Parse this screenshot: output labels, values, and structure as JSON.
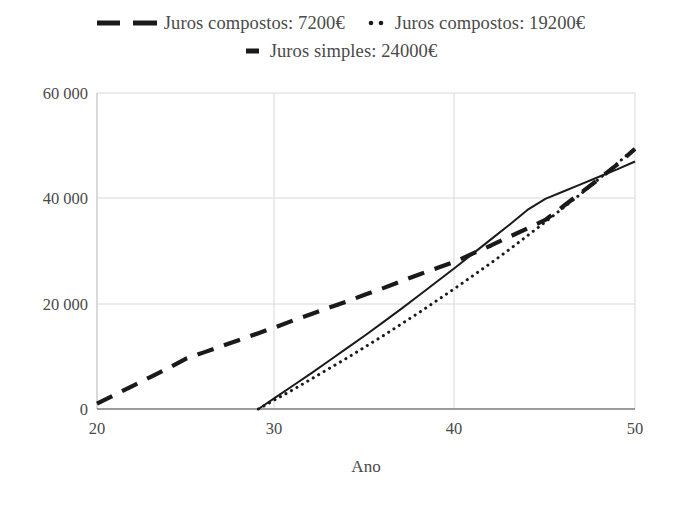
{
  "chart_data": {
    "type": "line",
    "title": "",
    "subtitle": "",
    "xlabel": "Ano",
    "ylabel": "",
    "xlim": [
      20,
      50
    ],
    "ylim": [
      0,
      60000
    ],
    "grid": true,
    "legend_position": "top",
    "x_ticks": [
      "20",
      "30",
      "40",
      "50"
    ],
    "x_tick_values": [
      20,
      30,
      40,
      50
    ],
    "y_ticks": [
      "0",
      "20 000",
      "40 000",
      "60 000"
    ],
    "y_tick_values": [
      0,
      20000,
      40000,
      60000
    ],
    "series": [
      {
        "name": "Juros compostos: 7200€",
        "style": "dashed",
        "marker": "long-dash-line",
        "color": "#1a1a1a",
        "x": [
          20,
          21,
          22,
          23,
          24,
          25,
          26,
          27,
          28,
          29,
          30,
          31,
          32,
          33,
          34,
          35,
          36,
          37,
          38,
          39,
          40,
          41,
          42,
          43,
          44,
          45,
          46,
          47,
          48,
          49,
          50
        ],
        "values": [
          1000,
          2700,
          4400,
          6100,
          7800,
          9600,
          10800,
          12000,
          13200,
          14400,
          15600,
          16900,
          18100,
          19300,
          20500,
          21800,
          23000,
          24300,
          25600,
          26800,
          28000,
          29600,
          31100,
          32700,
          34300,
          35900,
          38500,
          41100,
          43700,
          46400,
          49400
        ]
      },
      {
        "name": "Juros compostos: 19200€",
        "style": "dotted",
        "marker": "dotted-line",
        "color": "#1a1a1a",
        "x": [
          29,
          30,
          31,
          32,
          33,
          34,
          35,
          36,
          37,
          38,
          39,
          40,
          41,
          42,
          43,
          44,
          45,
          46,
          47,
          48,
          49,
          50
        ],
        "values": [
          0,
          1900,
          3800,
          5800,
          7800,
          9800,
          11900,
          14000,
          16200,
          18400,
          20700,
          23000,
          25400,
          27800,
          30300,
          32900,
          35500,
          38200,
          40900,
          43700,
          46600,
          49500
        ]
      },
      {
        "name": "Juros simples: 24000€",
        "style": "solid",
        "marker": "solid-line",
        "color": "#1a1a1a",
        "x": [
          29,
          30,
          31,
          32,
          33,
          34,
          35,
          36,
          37,
          38,
          39,
          40,
          41,
          42,
          43,
          44,
          45,
          46,
          47,
          48,
          49,
          50
        ],
        "values": [
          0,
          2300,
          4600,
          6900,
          9300,
          11700,
          14100,
          16600,
          19100,
          21700,
          24300,
          26900,
          29600,
          32300,
          35000,
          37800,
          39900,
          41300,
          42700,
          44100,
          45500,
          47000
        ]
      }
    ],
    "annotations": []
  },
  "legend": {
    "rows": [
      [
        {
          "label": "Juros compostos: 7200€",
          "marker": "long-dash-line"
        },
        {
          "label": "Juros compostos: 19200€",
          "marker": "dotted-line"
        }
      ],
      [
        {
          "label": "Juros simples: 24000€",
          "marker": "solid-line"
        }
      ]
    ]
  },
  "axes": {
    "x_label": "Ano",
    "y_label": ""
  },
  "colors": {
    "line": "#1a1a1a",
    "grid": "#d8d8d8",
    "axis": "#808080",
    "text": "#4a4a4a",
    "background": "#ffffff"
  }
}
